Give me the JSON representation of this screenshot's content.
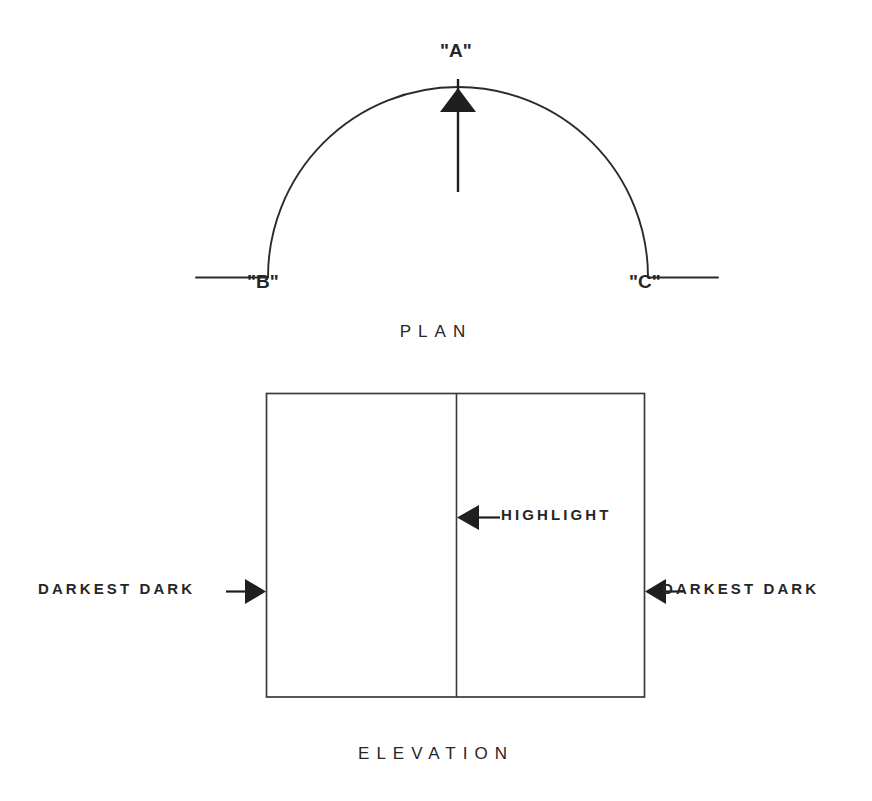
{
  "figure": {
    "background_color": "#ffffff",
    "ink_color": "#262626"
  },
  "plan": {
    "caption": "PLAN",
    "labels": {
      "apex": "\"A\"",
      "left_end": "\"B\"",
      "right_end": "\"C\""
    },
    "geometry": {
      "arc_center_x": 458,
      "arc_center_y": 277,
      "arc_radius": 190,
      "arc_apex_y": 87,
      "baseline_y": 277,
      "left_tail_x_start": 196,
      "right_tail_x_end": 718,
      "arrow_shaft_x": 458,
      "arrow_tail_y": 192,
      "arrow_tip_y": 78
    }
  },
  "elevation": {
    "caption": "ELEVATION",
    "geometry": {
      "left": 266,
      "top": 393,
      "right": 645,
      "bottom": 697,
      "divider_x": 456
    },
    "annotations": {
      "highlight": "HIGHLIGHT",
      "darkest_dark_left": "DARKEST DARK",
      "darkest_dark_right": "DARKEST DARK"
    },
    "leader_lines": {
      "highlight_y": 517,
      "highlight_tail_x": 497,
      "highlight_tip_x": 458,
      "darkest_y": 591,
      "left_tail_x": 228,
      "left_tip_x": 266,
      "right_tail_x": 683,
      "right_tip_x": 645
    }
  }
}
